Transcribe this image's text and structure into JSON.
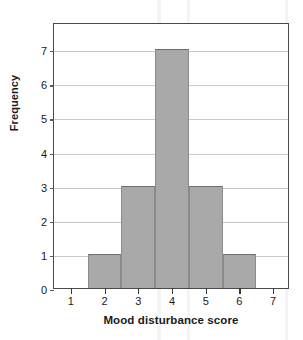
{
  "chart_data": {
    "type": "bar",
    "title": "",
    "subtitle": "",
    "xlabel": "Mood disturbance score",
    "ylabel": "Frequency",
    "categories": [
      1,
      2,
      3,
      4,
      5,
      6,
      7
    ],
    "values": [
      0,
      1,
      3,
      7,
      3,
      1,
      0
    ],
    "bars": [
      {
        "category": "1",
        "value": 0
      },
      {
        "category": "2",
        "value": 1
      },
      {
        "category": "3",
        "value": 3
      },
      {
        "category": "4",
        "value": 7
      },
      {
        "category": "5",
        "value": 3
      },
      {
        "category": "6",
        "value": 1
      },
      {
        "category": "7",
        "value": 0
      }
    ],
    "xtick_labels": [
      "1",
      "2",
      "3",
      "4",
      "5",
      "6",
      "7"
    ],
    "ytick_labels": [
      "0",
      "1",
      "2",
      "3",
      "4",
      "5",
      "6",
      "7"
    ],
    "xlim": [
      0.5,
      7.5
    ],
    "ylim": [
      0,
      7.8
    ],
    "grid": "horizontal",
    "legend": "none",
    "bar_color": "#a9a9a9",
    "bar_edge_color": "#6e6e6e",
    "gridline_color": "#c9c9c9",
    "frame_color": "#4a4a4a",
    "text_color": "#1a1a1a"
  }
}
